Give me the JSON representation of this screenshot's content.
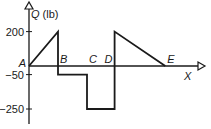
{
  "chart_data": {
    "type": "line",
    "title": "",
    "ylabel": "Q (lb)",
    "xlabel": "X",
    "y_ticks": [
      200,
      -50,
      -250
    ],
    "y_tick_labels": [
      "200",
      "-50",
      "-250"
    ],
    "ylim": [
      -250,
      200
    ],
    "points": [
      {
        "x": 0,
        "y": 0
      },
      {
        "x": 1,
        "y": 200
      },
      {
        "x": 1,
        "y": -50
      },
      {
        "x": 2,
        "y": -50
      },
      {
        "x": 2,
        "y": -250
      },
      {
        "x": 2.95,
        "y": -250
      },
      {
        "x": 2.95,
        "y": 200
      },
      {
        "x": 4.7,
        "y": 0
      }
    ],
    "point_labels": [
      {
        "label": "A",
        "x": 0
      },
      {
        "label": "B",
        "x": 1
      },
      {
        "label": "C",
        "x": 2
      },
      {
        "label": "D",
        "x": 2.95
      },
      {
        "label": "E",
        "x": 4.7
      }
    ],
    "xlim": [
      0,
      5.7
    ],
    "grid": false,
    "legend": "none"
  },
  "labels": {
    "y_axis": "Q (lb)",
    "x_axis": "X"
  }
}
